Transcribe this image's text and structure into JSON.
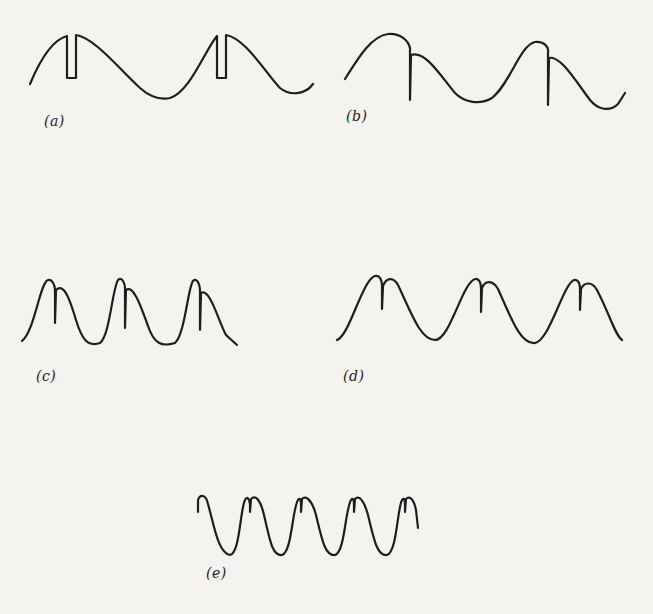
{
  "figure": {
    "panels": [
      {
        "id": "a",
        "label": "(a)",
        "description": "Sine wave with rectangular notch cut into each crest"
      },
      {
        "id": "b",
        "label": "(b)",
        "description": "Sine wave with sharp downward spike after each crest"
      },
      {
        "id": "c",
        "label": "(c)",
        "description": "Peaked waveform, three lobes with spike just right of each peak"
      },
      {
        "id": "d",
        "label": "(d)",
        "description": "Peaked waveform, three lobes with spike at the center of each peak"
      },
      {
        "id": "e",
        "label": "(e)",
        "description": "Higher-frequency waveform, five lobes with small notch at each peak"
      }
    ]
  },
  "colors": {
    "background": "#f4f3f0",
    "stroke": "#1e1e1e"
  }
}
